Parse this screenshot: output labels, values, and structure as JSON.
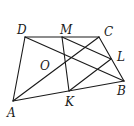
{
  "diagram": {
    "type": "geometry-figure",
    "points": {
      "A": {
        "label": "A",
        "x": 13,
        "y": 101,
        "lx": 7,
        "ly": 117
      },
      "B": {
        "label": "B",
        "x": 124,
        "y": 81,
        "lx": 117,
        "ly": 95
      },
      "C": {
        "label": "C",
        "x": 99,
        "y": 37,
        "lx": 104,
        "ly": 36
      },
      "D": {
        "label": "D",
        "x": 25,
        "y": 37,
        "lx": 17,
        "ly": 34
      },
      "M": {
        "label": "M",
        "x": 62,
        "y": 37,
        "lx": 60,
        "ly": 34
      },
      "L": {
        "label": "L",
        "x": 111,
        "y": 59,
        "lx": 117,
        "ly": 61
      },
      "K": {
        "label": "K",
        "x": 69,
        "y": 91,
        "lx": 65,
        "ly": 106
      },
      "O": {
        "label": "O",
        "x": 58,
        "y": 63,
        "lx": 40,
        "ly": 70
      }
    },
    "segments": [
      [
        "D",
        "C"
      ],
      [
        "D",
        "A"
      ],
      [
        "A",
        "B"
      ],
      [
        "B",
        "C"
      ],
      [
        "A",
        "C"
      ],
      [
        "D",
        "B"
      ],
      [
        "M",
        "K"
      ],
      [
        "M",
        "L"
      ],
      [
        "K",
        "L"
      ]
    ],
    "line_color": "#1a1a1a"
  }
}
